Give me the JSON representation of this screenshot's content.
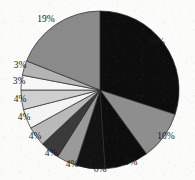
{
  "chart_data": {
    "type": "pie",
    "title": "",
    "subtitle": "",
    "xlabel": "",
    "ylabel": "",
    "grid": false,
    "legend_position": "none",
    "labels_shown_as": "percent",
    "total_percent": 100,
    "center": {
      "x": 100,
      "y": 90
    },
    "radius": 79,
    "start_angle_deg": 0,
    "direction": "clockwise",
    "categories": [
      "Slice 1",
      "Slice 2",
      "Slice 3",
      "Slice 4",
      "Slice 5",
      "Slice 6",
      "Slice 7",
      "Slice 8",
      "Slice 9",
      "Slice 10",
      "Slice 11",
      "Slice 12"
    ],
    "values": [
      30,
      10,
      9,
      6,
      4,
      4,
      4,
      4,
      4,
      3,
      3,
      19
    ],
    "slices": [
      {
        "label": "30%",
        "value": 30,
        "color": "#0d0d0d",
        "label_x": 156,
        "label_y": 43
      },
      {
        "label": "10%",
        "value": 10,
        "color": "#8e8e8e",
        "label_x": 166,
        "label_y": 137
      },
      {
        "label": "9%",
        "value": 9,
        "color": "#0d0d0d",
        "label_x": 131,
        "label_y": 163
      },
      {
        "label": "6%",
        "value": 6,
        "color": "#121212",
        "label_x": 100,
        "label_y": 170
      },
      {
        "label": "4%",
        "value": 4,
        "color": "#9a9a9a",
        "label_x": 72,
        "label_y": 165
      },
      {
        "label": "4%",
        "value": 4,
        "color": "#3a3a3a",
        "label_x": 51,
        "label_y": 154
      },
      {
        "label": "4%",
        "value": 4,
        "color": "#b9b9b9",
        "label_x": 35,
        "label_y": 137
      },
      {
        "label": "4%",
        "value": 4,
        "color": "#f4f4f4",
        "label_x": 24,
        "label_y": 118
      },
      {
        "label": "4%",
        "value": 4,
        "color": "#cfcfcf",
        "label_x": 20,
        "label_y": 100
      },
      {
        "label": "3%",
        "value": 3,
        "color": "#f7f7f7",
        "label_x": 19,
        "label_y": 82
      },
      {
        "label": "3%",
        "value": 3,
        "color": "#b4b4b4",
        "label_x": 20,
        "label_y": 66
      },
      {
        "label": "19%",
        "value": 19,
        "color": "#8a8a8a",
        "label_x": 46,
        "label_y": 20
      }
    ],
    "colors": {
      "black": "#0d0d0d",
      "dark_gray": "#3a3a3a",
      "medium_gray": "#8a8a8a",
      "light_gray": "#b9b9b9",
      "pale_gray": "#cfcfcf",
      "white": "#f7f7f7",
      "outline": "#2a2a2a",
      "background": "#fbfbfa",
      "label_text": "#1b1b1b"
    }
  }
}
